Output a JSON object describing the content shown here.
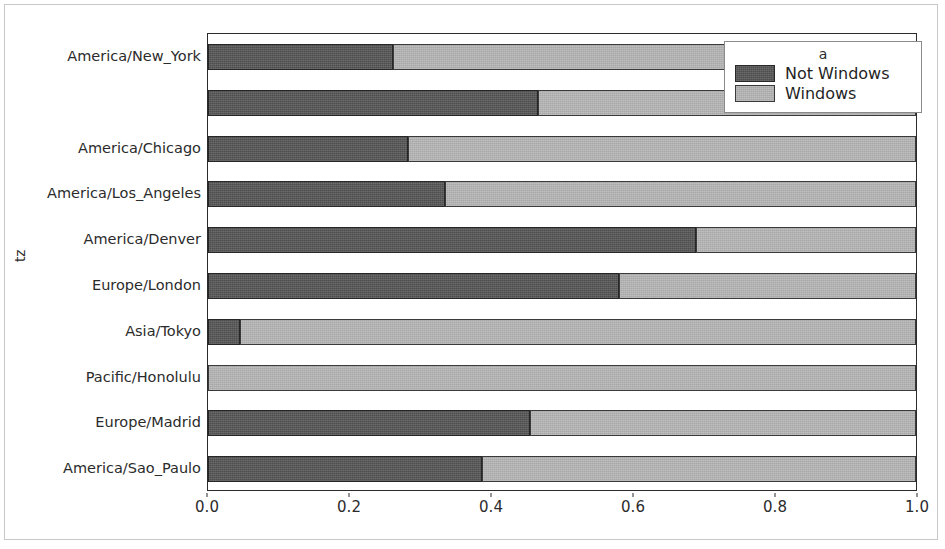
{
  "chart_data": {
    "type": "bar",
    "orientation": "horizontal",
    "stacked": true,
    "normalized": true,
    "title": "",
    "xlabel": "",
    "ylabel": "tz",
    "xlim": [
      0.0,
      1.0
    ],
    "xticks": [
      "0.0",
      "0.2",
      "0.4",
      "0.6",
      "0.8",
      "1.0"
    ],
    "xtick_values": [
      0.0,
      0.2,
      0.4,
      0.6,
      0.8,
      1.0
    ],
    "grid": false,
    "legend": {
      "title": "a",
      "position": "upper right",
      "entries": [
        {
          "label": "Not Windows",
          "color": "#4d4d4d"
        },
        {
          "label": "Windows",
          "color": "#a8a8a8"
        }
      ]
    },
    "categories": [
      "America/New_York",
      "",
      "America/Chicago",
      "America/Los_Angeles",
      "America/Denver",
      "Europe/London",
      "Asia/Tokyo",
      "Pacific/Honolulu",
      "Europe/Madrid",
      "America/Sao_Paulo"
    ],
    "series": [
      {
        "name": "Not Windows",
        "color": "#4d4d4d",
        "values": [
          0.262,
          0.466,
          0.283,
          0.335,
          0.689,
          0.58,
          0.045,
          0.0,
          0.455,
          0.387
        ]
      },
      {
        "name": "Windows",
        "color": "#a8a8a8",
        "values": [
          0.738,
          0.534,
          0.717,
          0.665,
          0.311,
          0.42,
          0.955,
          1.0,
          0.545,
          0.613
        ]
      }
    ]
  },
  "axis": {
    "y_title": "tz"
  }
}
